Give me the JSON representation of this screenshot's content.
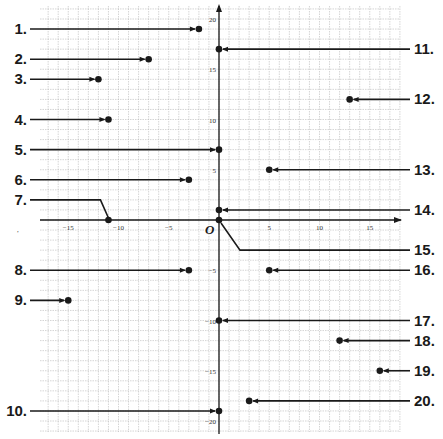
{
  "chart_data": {
    "type": "scatter",
    "title": "",
    "xlabel": "",
    "ylabel": "",
    "xlim": [
      -18,
      18
    ],
    "ylim": [
      -21,
      21
    ],
    "grid": true,
    "origin_label": "O",
    "x_ticks": [
      -15,
      -10,
      -5,
      5,
      10,
      15
    ],
    "y_ticks": [
      20,
      15,
      10,
      5,
      -5,
      -10,
      -15,
      -20
    ],
    "points": [
      {
        "label": "1.",
        "x": -2,
        "y": 19,
        "side": "left"
      },
      {
        "label": "2.",
        "x": -7,
        "y": 16,
        "side": "left"
      },
      {
        "label": "3.",
        "x": -12,
        "y": 14,
        "side": "left"
      },
      {
        "label": "4.",
        "x": -11,
        "y": 10,
        "side": "left"
      },
      {
        "label": "5.",
        "x": 0,
        "y": 7,
        "side": "left"
      },
      {
        "label": "6.",
        "x": -3,
        "y": 4,
        "side": "left"
      },
      {
        "label": "7.",
        "x": -11,
        "y": 0,
        "side": "left",
        "bent": true
      },
      {
        "label": "8.",
        "x": -3,
        "y": -5,
        "side": "left"
      },
      {
        "label": "9.",
        "x": -15,
        "y": -8,
        "side": "left"
      },
      {
        "label": "10.",
        "x": 0,
        "y": -19,
        "side": "left"
      },
      {
        "label": "11.",
        "x": 0,
        "y": 17,
        "side": "right"
      },
      {
        "label": "12.",
        "x": 13,
        "y": 12,
        "side": "right"
      },
      {
        "label": "13.",
        "x": 5,
        "y": 5,
        "side": "right"
      },
      {
        "label": "14.",
        "x": 0,
        "y": 1,
        "side": "right"
      },
      {
        "label": "15.",
        "x": 0,
        "y": 0,
        "side": "right",
        "bent": true
      },
      {
        "label": "16.",
        "x": 5,
        "y": -5,
        "side": "right"
      },
      {
        "label": "17.",
        "x": 0,
        "y": -10,
        "side": "right"
      },
      {
        "label": "18.",
        "x": 12,
        "y": -12,
        "side": "right"
      },
      {
        "label": "19.",
        "x": 16,
        "y": -15,
        "side": "right"
      },
      {
        "label": "20.",
        "x": 3,
        "y": -18,
        "side": "right"
      }
    ]
  },
  "colors": {
    "ink": "#1a1a1a",
    "grid": "#b8b8b8",
    "grid_dot": "#d0d0d0",
    "background": "#ffffff"
  }
}
